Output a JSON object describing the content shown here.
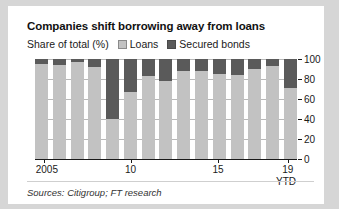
{
  "chart_data": {
    "type": "bar",
    "title": "Companies shift borrowing away from loans",
    "subtitle": "Share of total (%)",
    "xlabel": "",
    "ylabel": "",
    "ylim": [
      0,
      100
    ],
    "yticks": [
      0,
      20,
      40,
      60,
      80,
      100
    ],
    "grid": true,
    "stacked": true,
    "legend_position": "top",
    "categories": [
      "2005",
      "2006",
      "2007",
      "2008",
      "2009",
      "2010",
      "2011",
      "2012",
      "2013",
      "2014",
      "2015",
      "2016",
      "2017",
      "2018",
      "19 YTD"
    ],
    "xtick_labels": [
      "2005",
      "10",
      "15",
      "19"
    ],
    "xtick_categories": [
      "2005",
      "2010",
      "2015",
      "19 YTD"
    ],
    "series": [
      {
        "name": "Loans",
        "color": "#c2c2c2",
        "values": [
          95,
          94,
          97,
          92,
          40,
          67,
          83,
          78,
          88,
          88,
          85,
          84,
          90,
          93,
          71
        ]
      },
      {
        "name": "Secured bonds",
        "color": "#5a5a5a",
        "values": [
          5,
          6,
          3,
          8,
          60,
          33,
          17,
          22,
          12,
          12,
          15,
          16,
          10,
          7,
          29
        ]
      }
    ],
    "annotations": [
      "YTD"
    ],
    "sources": "Sources: Citigroup; FT research"
  },
  "legend": {
    "items": [
      {
        "label": "Loans",
        "swatch": "loans"
      },
      {
        "label": "Secured bonds",
        "swatch": "bonds"
      }
    ]
  },
  "axis": {
    "ytd_note": "YTD"
  }
}
